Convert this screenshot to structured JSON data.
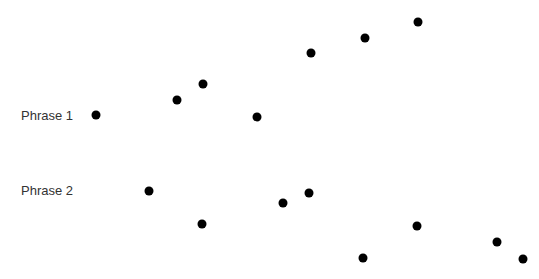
{
  "labels": [
    {
      "text": "Phrase 1",
      "x": 21,
      "y": 109
    },
    {
      "text": "Phrase 2",
      "x": 21,
      "y": 184
    }
  ],
  "dot_color": "#000000",
  "series": [
    {
      "name": "Phrase 1",
      "points": [
        {
          "x": 96,
          "y": 115
        },
        {
          "x": 177,
          "y": 100
        },
        {
          "x": 203,
          "y": 84
        },
        {
          "x": 257,
          "y": 117
        },
        {
          "x": 311,
          "y": 53
        },
        {
          "x": 365,
          "y": 38
        },
        {
          "x": 418,
          "y": 22
        }
      ]
    },
    {
      "name": "Phrase 2",
      "points": [
        {
          "x": 149,
          "y": 191
        },
        {
          "x": 202,
          "y": 224
        },
        {
          "x": 283,
          "y": 203
        },
        {
          "x": 309,
          "y": 193
        },
        {
          "x": 363,
          "y": 258
        },
        {
          "x": 417,
          "y": 226
        },
        {
          "x": 497,
          "y": 242
        },
        {
          "x": 523,
          "y": 259
        }
      ]
    }
  ]
}
